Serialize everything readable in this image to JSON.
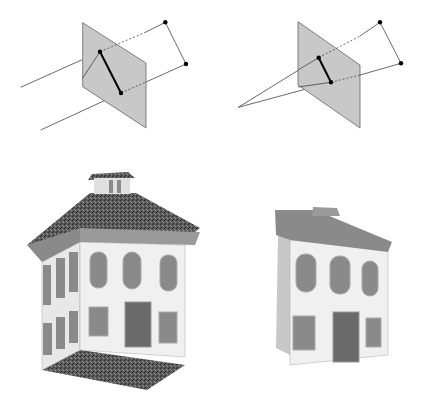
{
  "figure": {
    "panels": [
      {
        "id": "parallel-projection",
        "label": "Parallel (orthographic) projection diagram"
      },
      {
        "id": "perspective-projection",
        "label": "Perspective projection diagram"
      },
      {
        "id": "house-orthographic",
        "label": "House rendered with parallel projection"
      },
      {
        "id": "house-perspective",
        "label": "House rendered with perspective projection"
      }
    ]
  },
  "colors": {
    "background": "#ffffff",
    "plane_fill": "#c8c8c8",
    "plane_stroke": "#666666",
    "line": "#444444",
    "point": "#000000",
    "roof": "#4a4a4a",
    "wall": "#eeeeee",
    "window": "#8a8a8a",
    "trim": "#9a9a9a"
  }
}
